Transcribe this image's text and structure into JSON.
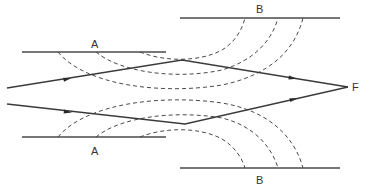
{
  "diagram": {
    "type": "ray-optics-lens-wavefronts",
    "labels": {
      "a_top": "A",
      "b_top": "B",
      "a_bottom": "A",
      "b_bottom": "B",
      "focus": "F"
    },
    "plates": [
      {
        "id": "B-top",
        "label": "B",
        "x1": 180,
        "x2": 340,
        "y": 18
      },
      {
        "id": "A-top",
        "label": "A",
        "x1": 22,
        "x2": 166,
        "y": 52
      },
      {
        "id": "A-bottom",
        "label": "A",
        "x1": 22,
        "x2": 166,
        "y": 137
      },
      {
        "id": "B-bottom",
        "label": "B",
        "x1": 180,
        "x2": 340,
        "y": 168
      }
    ],
    "rays": [
      {
        "id": "upper",
        "points": [
          [
            7,
            88
          ],
          [
            182,
            60
          ],
          [
            348,
            87
          ]
        ]
      },
      {
        "id": "lower",
        "points": [
          [
            7,
            104
          ],
          [
            185,
            124
          ],
          [
            348,
            87
          ]
        ]
      }
    ],
    "focus_point": [
      348,
      87
    ],
    "colors": {
      "line": "#4a4a4a",
      "ray": "#3a3a3a",
      "text": "#333333",
      "background": "#ffffff"
    }
  }
}
